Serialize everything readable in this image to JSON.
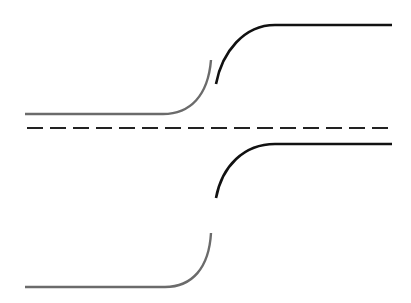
{
  "diagram": {
    "type": "schematic-symmetric-profile",
    "colors": {
      "background": "#ffffff",
      "left_segment": "#6b6b6b",
      "right_segment": "#111111",
      "centerline": "#222222"
    },
    "centerline": {
      "y": 128,
      "x_start": 27,
      "x_end": 390,
      "dash": "16 7"
    },
    "upper_profile": {
      "left_segment": {
        "path": "M25 114 L163 114 C190 114 208 96 211 60"
      },
      "right_segment": {
        "path": "M216 84 C222 52 244 25 275 25 L392 25"
      }
    },
    "lower_profile": {
      "left_segment": {
        "path": "M25 287 L165 287 C192 287 209 268 211 233"
      },
      "right_segment": {
        "path": "M216 198 C222 166 244 144 275 144 L392 144"
      }
    }
  }
}
